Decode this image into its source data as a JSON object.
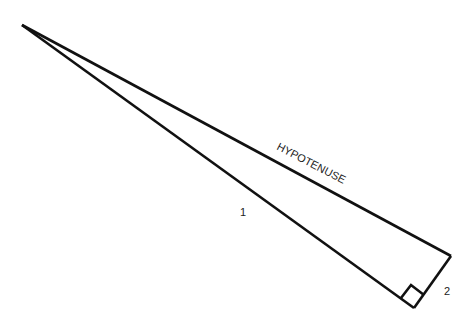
{
  "diagram": {
    "stroke_color": "#111111",
    "vertices": {
      "apex": [
        22,
        25
      ],
      "right_angle": [
        414,
        308
      ],
      "top_right": [
        451,
        256
      ]
    },
    "labels": {
      "hypotenuse": "HYPOTENUSE",
      "leg_long": "1",
      "leg_short": "2"
    }
  }
}
